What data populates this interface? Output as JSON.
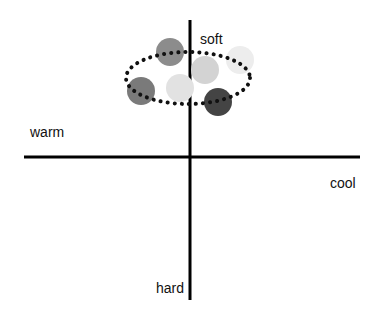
{
  "axes": {
    "top_label": "soft",
    "bottom_label": "hard",
    "left_label": "warm",
    "right_label": "cool",
    "line_color": "#000000"
  },
  "cluster": {
    "outline_style": "dotted",
    "outline_color": "#111111",
    "circles": [
      {
        "name": "medium-gray",
        "cx": 170,
        "cy": 52,
        "r": 14,
        "color": "#8c8c8c"
      },
      {
        "name": "very-light-gray",
        "cx": 240,
        "cy": 60,
        "r": 14,
        "color": "#ededed"
      },
      {
        "name": "light-gray",
        "cx": 205,
        "cy": 70,
        "r": 14,
        "color": "#d3d3d3"
      },
      {
        "name": "dark-gray-left",
        "cx": 141,
        "cy": 91,
        "r": 14,
        "color": "#7a7a7a"
      },
      {
        "name": "pale-gray",
        "cx": 180,
        "cy": 88,
        "r": 14,
        "color": "#e2e2e2"
      },
      {
        "name": "charcoal",
        "cx": 218,
        "cy": 102,
        "r": 14,
        "color": "#444444"
      }
    ]
  }
}
